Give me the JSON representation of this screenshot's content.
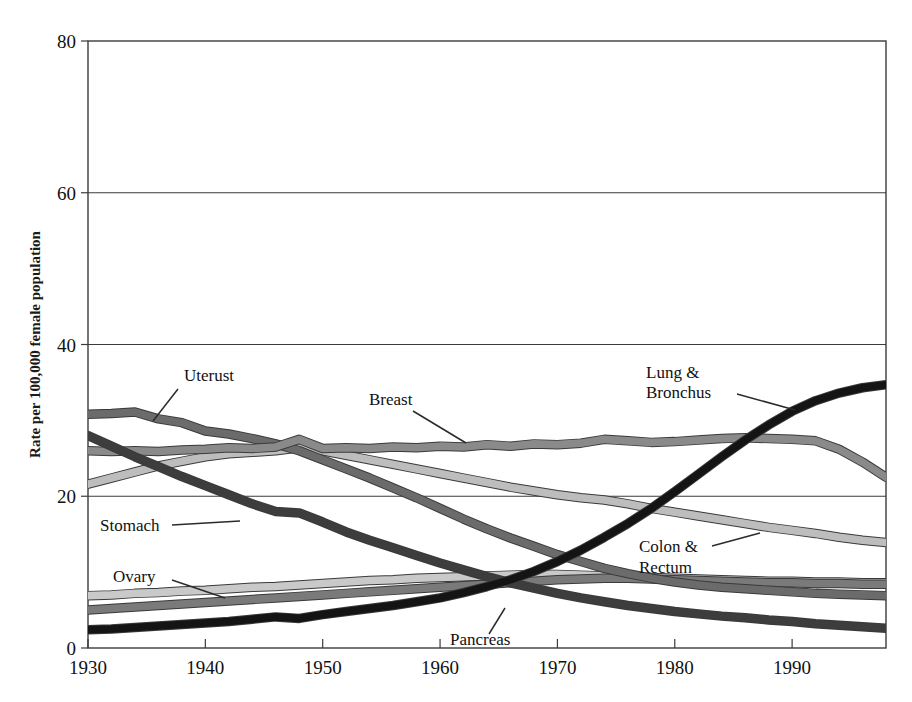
{
  "chart_data": {
    "type": "line",
    "title": "",
    "xlabel": "",
    "ylabel": "Rate per 100,000 female population",
    "xlim": [
      1930,
      1998
    ],
    "ylim": [
      0,
      80
    ],
    "xticks": [
      1930,
      1940,
      1950,
      1960,
      1970,
      1980,
      1990
    ],
    "xtick_labels": [
      "1930",
      "1940",
      "1950",
      "1960",
      "1970",
      "1980",
      "1990"
    ],
    "yticks": [
      0,
      20,
      40,
      60,
      80
    ],
    "ytick_labels": [
      "0",
      "20",
      "40",
      "60",
      "80"
    ],
    "grid": "horizontal-at-20-40-60",
    "legend": "inline-annotations",
    "x": [
      1930,
      1932,
      1934,
      1936,
      1938,
      1940,
      1942,
      1944,
      1946,
      1948,
      1950,
      1952,
      1954,
      1956,
      1958,
      1960,
      1962,
      1964,
      1966,
      1968,
      1970,
      1972,
      1974,
      1976,
      1978,
      1980,
      1982,
      1984,
      1986,
      1988,
      1990,
      1992,
      1994,
      1996,
      1998
    ],
    "series": [
      {
        "name": "Uterust",
        "color": "#6b6b6b",
        "values": [
          30.8,
          30.9,
          31.1,
          30.2,
          29.7,
          28.6,
          28.2,
          27.6,
          26.9,
          26.0,
          24.8,
          23.6,
          22.4,
          21.1,
          19.8,
          18.4,
          17.0,
          15.7,
          14.5,
          13.4,
          12.3,
          11.4,
          10.5,
          9.8,
          9.2,
          8.7,
          8.3,
          8.0,
          7.8,
          7.6,
          7.4,
          7.2,
          7.1,
          7.0,
          6.9
        ]
      },
      {
        "name": "Stomach",
        "color": "#3d3d3d",
        "values": [
          28.0,
          26.6,
          25.2,
          23.9,
          22.6,
          21.4,
          20.2,
          19.0,
          18.0,
          17.8,
          16.6,
          15.3,
          14.2,
          13.2,
          12.2,
          11.2,
          10.3,
          9.4,
          8.6,
          7.9,
          7.2,
          6.6,
          6.1,
          5.6,
          5.2,
          4.8,
          4.5,
          4.2,
          4.0,
          3.7,
          3.5,
          3.2,
          3.0,
          2.8,
          2.6
        ]
      },
      {
        "name": "Breast",
        "color": "#8a8a8a",
        "values": [
          26.0,
          25.9,
          26.0,
          25.9,
          26.1,
          26.2,
          26.4,
          26.3,
          26.5,
          27.5,
          26.3,
          26.4,
          26.3,
          26.5,
          26.4,
          26.6,
          26.5,
          26.8,
          26.6,
          26.9,
          26.8,
          27.0,
          27.5,
          27.3,
          27.1,
          27.2,
          27.4,
          27.6,
          27.7,
          27.6,
          27.5,
          27.3,
          26.2,
          24.5,
          22.5
        ]
      },
      {
        "name": "Colon & Rectum",
        "color": "#bdbdbd",
        "values": [
          21.6,
          22.4,
          23.2,
          24.0,
          24.6,
          25.2,
          25.6,
          25.8,
          26.0,
          26.4,
          26.0,
          25.4,
          24.8,
          24.2,
          23.6,
          23.0,
          22.4,
          21.8,
          21.2,
          20.7,
          20.2,
          19.8,
          19.5,
          19.0,
          18.4,
          17.9,
          17.4,
          16.9,
          16.4,
          15.9,
          15.5,
          15.1,
          14.6,
          14.2,
          13.9
        ]
      },
      {
        "name": "Ovary",
        "color": "#c9c9c9",
        "values": [
          6.9,
          7.0,
          7.2,
          7.3,
          7.5,
          7.6,
          7.8,
          8.0,
          8.1,
          8.3,
          8.5,
          8.7,
          8.9,
          9.0,
          9.2,
          9.3,
          9.4,
          9.5,
          9.6,
          9.7,
          9.7,
          9.6,
          9.5,
          9.4,
          9.3,
          9.2,
          9.1,
          9.0,
          8.9,
          8.8,
          8.8,
          8.7,
          8.7,
          8.6,
          8.6
        ]
      },
      {
        "name": "Pancreas",
        "color": "#7a7a7a",
        "values": [
          5.0,
          5.2,
          5.4,
          5.6,
          5.8,
          6.0,
          6.2,
          6.4,
          6.6,
          6.8,
          7.0,
          7.2,
          7.4,
          7.6,
          7.8,
          8.0,
          8.2,
          8.4,
          8.6,
          8.8,
          9.0,
          9.1,
          9.2,
          9.2,
          9.1,
          9.0,
          8.9,
          8.8,
          8.7,
          8.6,
          8.6,
          8.5,
          8.5,
          8.4,
          8.4
        ]
      },
      {
        "name": "Lung & Bronchus",
        "color": "#141414",
        "values": [
          2.4,
          2.5,
          2.7,
          2.9,
          3.1,
          3.3,
          3.5,
          3.8,
          4.1,
          3.9,
          4.4,
          4.8,
          5.2,
          5.6,
          6.1,
          6.6,
          7.3,
          8.1,
          9.0,
          10.1,
          11.4,
          12.9,
          14.6,
          16.4,
          18.4,
          20.6,
          22.9,
          25.2,
          27.4,
          29.4,
          31.2,
          32.6,
          33.6,
          34.3,
          34.7
        ]
      }
    ],
    "annotations": [
      {
        "label": "Uterust",
        "text_x": 184,
        "text_y": 381,
        "leader": [
          [
            178,
            389
          ],
          [
            153,
            421
          ]
        ]
      },
      {
        "label": "Breast",
        "text_x": 369,
        "text_y": 405,
        "leader": [
          [
            413,
            411
          ],
          [
            466,
            443
          ]
        ]
      },
      {
        "label": "Lung &",
        "text_x": 646,
        "text_y": 378,
        "leader": null
      },
      {
        "label": "Bronchus",
        "text_x": 646,
        "text_y": 398,
        "leader": [
          [
            737,
            394
          ],
          [
            795,
            410
          ]
        ]
      },
      {
        "label": "Stomach",
        "text_x": 100,
        "text_y": 531,
        "leader": [
          [
            172,
            525
          ],
          [
            240,
            521
          ]
        ]
      },
      {
        "label": "Colon &",
        "text_x": 639,
        "text_y": 552,
        "leader": [
          [
            712,
            546
          ],
          [
            760,
            533
          ]
        ]
      },
      {
        "label": "Rectum",
        "text_x": 639,
        "text_y": 573,
        "leader": null
      },
      {
        "label": "Ovary",
        "text_x": 113,
        "text_y": 582,
        "leader": [
          [
            172,
            580
          ],
          [
            225,
            598
          ]
        ]
      },
      {
        "label": "Pancreas",
        "text_x": 450,
        "text_y": 645,
        "leader": [
          [
            489,
            634
          ],
          [
            505,
            608
          ]
        ]
      }
    ]
  },
  "axis": {
    "ylabel": "Rate per 100,000 female population"
  }
}
